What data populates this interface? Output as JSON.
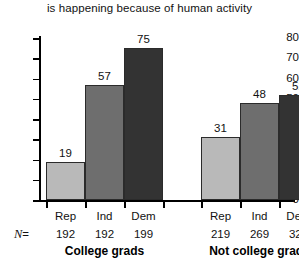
{
  "chart_data": {
    "type": "bar",
    "title": "is happening because of human activity",
    "xlabel": "",
    "ylabel": "",
    "ylim": [
      0,
      80
    ],
    "yticks": [
      0,
      10,
      20,
      30,
      40,
      50,
      60,
      70,
      80
    ],
    "grid": false,
    "legend": "none",
    "categories": [
      "Rep",
      "Ind",
      "Dem",
      "Rep",
      "Ind",
      "Dem"
    ],
    "values": [
      19,
      57,
      75,
      31,
      48,
      52
    ],
    "groups": [
      {
        "label": "College grads",
        "bars": [
          {
            "category": "Rep",
            "value": 19,
            "n": "192",
            "color": "#b9b9b9"
          },
          {
            "category": "Ind",
            "value": 57,
            "n": "192",
            "color": "#6e6e6e"
          },
          {
            "category": "Dem",
            "value": 75,
            "n": "199",
            "color": "#333333"
          }
        ]
      },
      {
        "label": "Not college grads",
        "bars": [
          {
            "category": "Rep",
            "value": 31,
            "n": "219",
            "color": "#b9b9b9"
          },
          {
            "category": "Ind",
            "value": 48,
            "n": "269",
            "color": "#6e6e6e"
          },
          {
            "category": "Dem",
            "value": 52,
            "n": "320",
            "color": "#333333"
          }
        ]
      }
    ],
    "n_prefix": "N =",
    "n_prefix_symbol": "N",
    "n_prefix_equals": "=",
    "colors": {
      "rep": "#b9b9b9",
      "ind": "#6e6e6e",
      "dem": "#333333",
      "axis": "#000000",
      "text": "#111111",
      "background": "#ffffff"
    }
  }
}
